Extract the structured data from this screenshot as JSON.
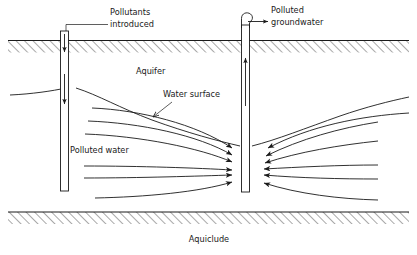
{
  "figure": {
    "background_color": "#ffffff",
    "line_color": "#1a1a1a",
    "width": 417,
    "height": 255
  },
  "labels": {
    "pollutants_introduced_line1": "Pollutants",
    "pollutants_introduced_line2": "introduced",
    "polluted_groundwater_line1": "Polluted",
    "polluted_groundwater_line2": "groundwater",
    "aquifer": "Aquifer",
    "water_surface": "Water surface",
    "polluted_water": "Polluted water",
    "aquiclude": "Aquiclude"
  },
  "icons": {
    "ground_surface_hatching": "hatch-icon",
    "aquiclude_hatching": "hatch-icon",
    "recharge_well": "well-icon",
    "pumping_well": "well-icon",
    "discharge_spout": "spout-icon",
    "flow_arrow": "arrow-icon",
    "leader_arrow": "leader-arrow-icon"
  },
  "elements": {
    "recharge_well_label": "recharge well (left)",
    "pumping_well_label": "pumping well (right)",
    "downward_flow_arrows": 2,
    "upward_flow_arrows": 1,
    "left_streamlines": 6,
    "right_streamlines": 6,
    "ground_surface_label": "ground surface",
    "aquiclude_boundary_label": "aquiclude boundary"
  }
}
